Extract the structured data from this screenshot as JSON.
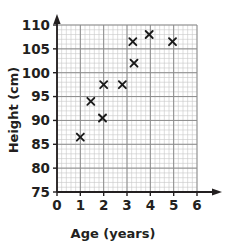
{
  "chart_data": {
    "type": "scatter",
    "title": "",
    "xlabel": "Age (years)",
    "ylabel": "Height (cm)",
    "xlim": [
      0,
      6
    ],
    "ylim": [
      75,
      110
    ],
    "xticks": [
      "0",
      "1",
      "2",
      "3",
      "4",
      "5",
      "6"
    ],
    "yticks": [
      "75",
      "80",
      "85",
      "90",
      "95",
      "100",
      "105",
      "110"
    ],
    "xtick_values": [
      0,
      1,
      2,
      3,
      4,
      5,
      6
    ],
    "ytick_values": [
      75,
      80,
      85,
      90,
      95,
      100,
      105,
      110
    ],
    "grid": true,
    "grid_minor_step_x": 0.2,
    "grid_minor_step_y": 1,
    "grid_major_step_x": 1,
    "grid_major_step_y": 5,
    "legend": "none",
    "marker": "x",
    "marker_color": "#1a1a1a",
    "grid_color": "#c8c8c8",
    "grid_major_color": "#8c8c8c",
    "axis_color": "#231f20",
    "points": [
      {
        "x": 1.0,
        "y": 86.5
      },
      {
        "x": 1.45,
        "y": 94.0
      },
      {
        "x": 1.95,
        "y": 90.5
      },
      {
        "x": 2.0,
        "y": 97.5
      },
      {
        "x": 2.8,
        "y": 97.5
      },
      {
        "x": 3.25,
        "y": 106.5
      },
      {
        "x": 3.3,
        "y": 102.0
      },
      {
        "x": 3.95,
        "y": 108.0
      },
      {
        "x": 4.95,
        "y": 106.5
      }
    ]
  }
}
